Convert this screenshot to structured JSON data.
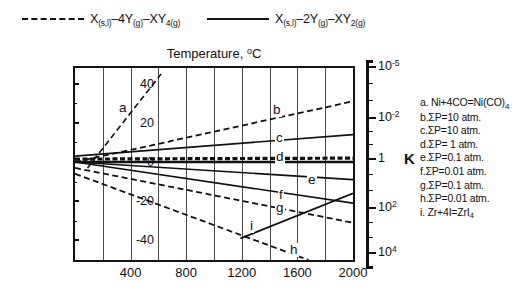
{
  "legend": {
    "entries": [
      {
        "style": "dashed",
        "text": "X(s,l)–4Y(g)–XY4(g)",
        "main": "X",
        "sub1": "(s,l)",
        "mid": "–4Y",
        "sub2": "(g)",
        "mid2": "–XY",
        "sub3": "4(g)"
      },
      {
        "style": "solid",
        "text": "X(s,l)–2Y(g)–XY2(g)",
        "main": "X",
        "sub1": "(s,l)",
        "mid": "–2Y",
        "sub2": "(g)",
        "mid2": "–XY",
        "sub3": "2(g)"
      }
    ]
  },
  "axes": {
    "x_title": "Temperature, ",
    "x_title_sup": "o",
    "x_title_tail": "C",
    "y_title": "ΔG",
    "y_title_sup": "o",
    "y_title_tail": ", kCal",
    "k_title": "K",
    "x_ticks": [
      "400",
      "800",
      "1200",
      "1600",
      "2000"
    ],
    "x_tick_values": [
      400,
      800,
      1200,
      1600,
      2000
    ],
    "x_min": 0,
    "x_max": 2000,
    "x_gridline_step": 200,
    "y_ticks": [
      "40",
      "20",
      "0",
      "-20",
      "-40"
    ],
    "y_tick_values": [
      40,
      20,
      0,
      -20,
      -40
    ],
    "y_min": -50,
    "y_max": 48,
    "k_ticks": [
      {
        "base": "10",
        "exp": "-5"
      },
      {
        "base": "10",
        "exp": "-2"
      },
      {
        "base": "1",
        "exp": ""
      },
      {
        "base": "10",
        "exp": "2"
      },
      {
        "base": "10",
        "exp": "4"
      }
    ],
    "k_tick_y": [
      66,
      117,
      158,
      207,
      252
    ]
  },
  "annotations": {
    "items": [
      {
        "id": "a",
        "label": "a. Ni+4CO=Ni(CO)",
        "sub": "4"
      },
      {
        "id": "b",
        "label": "b.ΣP=10 atm.",
        "sub": ""
      },
      {
        "id": "c",
        "label": "c.ΣP=10 atm.",
        "sub": ""
      },
      {
        "id": "d",
        "label": "d.ΣP=  1 atm.",
        "sub": ""
      },
      {
        "id": "e",
        "label": "e.ΣP=0.1 atm.",
        "sub": ""
      },
      {
        "id": "f",
        "label": "f.ΣP=0.01 atm.",
        "sub": ""
      },
      {
        "id": "g",
        "label": "g.ΣP=0.1 atm.",
        "sub": ""
      },
      {
        "id": "h",
        "label": "h.ΣP=0.01 atm.",
        "sub": ""
      },
      {
        "id": "i",
        "label": "i. Zr+4I=ZrI",
        "sub": "4"
      }
    ]
  },
  "curve_labels": [
    {
      "id": "a",
      "text": "a",
      "x": 118,
      "y": 101
    },
    {
      "id": "b",
      "text": "b",
      "x": 272,
      "y": 103
    },
    {
      "id": "c",
      "text": "c",
      "x": 275,
      "y": 131
    },
    {
      "id": "d",
      "text": "d",
      "x": 275,
      "y": 150
    },
    {
      "id": "e",
      "text": "e",
      "x": 307,
      "y": 173
    },
    {
      "id": "f",
      "text": "f",
      "x": 278,
      "y": 188
    },
    {
      "id": "g",
      "text": "g",
      "x": 275,
      "y": 201
    },
    {
      "id": "h",
      "text": "h",
      "x": 289,
      "y": 243
    },
    {
      "id": "i",
      "text": "i",
      "x": 249,
      "y": 219
    }
  ],
  "chart_data": {
    "type": "line",
    "xlabel": "Temperature, °C",
    "ylabel": "ΔG°, kCal",
    "y2label": "K",
    "xlim": [
      0,
      2000
    ],
    "ylim": [
      -50,
      48
    ],
    "y2_ticks": [
      "10^-5",
      "10^-2",
      "1",
      "10^2",
      "10^4"
    ],
    "grid": true,
    "grid_axis": "x",
    "grid_step": 200,
    "legend_position": "top",
    "legend_entries": [
      "X(s,l)-4Y(g)-XY4(g)  (dashed)",
      "X(s,l)-2Y(g)-XY2(g)  (solid)"
    ],
    "series": [
      {
        "name": "a",
        "note": "Ni+4CO=Ni(CO)4",
        "style": "dashed",
        "width": 1.6,
        "points": [
          [
            90,
            -3
          ],
          [
            620,
            45
          ]
        ]
      },
      {
        "name": "b",
        "note": "ΣP=10 atm.",
        "style": "dashed",
        "width": 1.8,
        "points": [
          [
            0,
            0
          ],
          [
            2000,
            31
          ]
        ]
      },
      {
        "name": "c",
        "note": "ΣP=10 atm.",
        "style": "solid",
        "width": 1.6,
        "points": [
          [
            0,
            3
          ],
          [
            2000,
            14
          ]
        ]
      },
      {
        "name": "d",
        "note": "ΣP=1 atm.",
        "style": "dashed",
        "width": 3.2,
        "points": [
          [
            0,
            1.5
          ],
          [
            2000,
            2
          ]
        ]
      },
      {
        "name": "d2",
        "note": "ΣP=1 atm. solid companion",
        "style": "solid",
        "width": 2.6,
        "points": [
          [
            0,
            0
          ],
          [
            2000,
            0
          ]
        ]
      },
      {
        "name": "e",
        "note": "ΣP=0.1 atm.",
        "style": "solid",
        "width": 1.6,
        "points": [
          [
            0,
            0
          ],
          [
            2000,
            -9
          ]
        ]
      },
      {
        "name": "f",
        "note": "ΣP=0.01 atm.",
        "style": "solid",
        "width": 1.6,
        "points": [
          [
            0,
            0
          ],
          [
            2000,
            -21
          ]
        ]
      },
      {
        "name": "g",
        "note": "ΣP=0.1 atm.",
        "style": "dashed",
        "width": 1.8,
        "points": [
          [
            0,
            -3
          ],
          [
            2000,
            -31
          ]
        ]
      },
      {
        "name": "h",
        "note": "ΣP=0.01 atm.",
        "style": "dashed",
        "width": 1.8,
        "points": [
          [
            0,
            -6
          ],
          [
            1680,
            -50
          ]
        ]
      },
      {
        "name": "i",
        "note": "Zr+4I=ZrI4",
        "style": "solid",
        "width": 1.8,
        "points": [
          [
            1190,
            -39
          ],
          [
            2000,
            -16
          ]
        ]
      }
    ]
  }
}
